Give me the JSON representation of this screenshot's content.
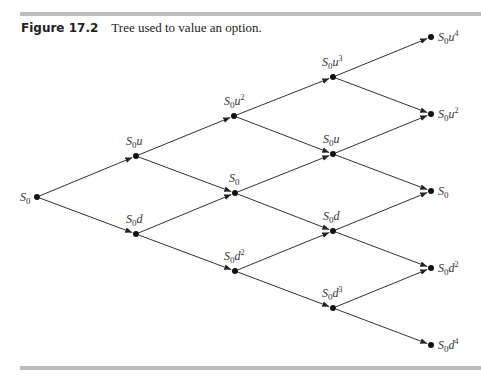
{
  "figure": {
    "number": "Figure 17.2",
    "title": "Tree used to value an option."
  },
  "tree": {
    "nodes": [
      {
        "id": "n00",
        "x": 37,
        "y": 197,
        "label": "S0",
        "sub": "0",
        "base": "S",
        "suffix": "",
        "exp": "",
        "lx": 20,
        "ly": 201
      },
      {
        "id": "n10",
        "x": 136,
        "y": 156,
        "base": "S",
        "sub": "0",
        "suffix": "u",
        "exp": "",
        "lx": 126,
        "ly": 145
      },
      {
        "id": "n11",
        "x": 136,
        "y": 234,
        "base": "S",
        "sub": "0",
        "suffix": "d",
        "exp": "",
        "lx": 126,
        "ly": 223
      },
      {
        "id": "n20",
        "x": 234,
        "y": 116,
        "base": "S",
        "sub": "0",
        "suffix": "u",
        "exp": "2",
        "lx": 224,
        "ly": 105
      },
      {
        "id": "n21",
        "x": 235,
        "y": 193,
        "base": "S",
        "sub": "0",
        "suffix": "",
        "exp": "",
        "lx": 229,
        "ly": 182
      },
      {
        "id": "n22",
        "x": 235,
        "y": 271,
        "base": "S",
        "sub": "0",
        "suffix": "d",
        "exp": "2",
        "lx": 224,
        "ly": 260
      },
      {
        "id": "n30",
        "x": 333,
        "y": 77,
        "base": "S",
        "sub": "0",
        "suffix": "u",
        "exp": "3",
        "lx": 322,
        "ly": 66
      },
      {
        "id": "n31",
        "x": 333,
        "y": 154,
        "base": "S",
        "sub": "0",
        "suffix": "u",
        "exp": "",
        "lx": 323,
        "ly": 143
      },
      {
        "id": "n32",
        "x": 333,
        "y": 231,
        "base": "S",
        "sub": "0",
        "suffix": "d",
        "exp": "",
        "lx": 323,
        "ly": 220
      },
      {
        "id": "n33",
        "x": 333,
        "y": 308,
        "base": "S",
        "sub": "0",
        "suffix": "d",
        "exp": "3",
        "lx": 322,
        "ly": 297
      },
      {
        "id": "n40",
        "x": 431,
        "y": 37,
        "base": "S",
        "sub": "0",
        "suffix": "u",
        "exp": "4",
        "lx": 438,
        "ly": 41
      },
      {
        "id": "n41",
        "x": 431,
        "y": 114,
        "base": "S",
        "sub": "0",
        "suffix": "u",
        "exp": "2",
        "lx": 438,
        "ly": 118
      },
      {
        "id": "n42",
        "x": 431,
        "y": 191,
        "base": "S",
        "sub": "0",
        "suffix": "",
        "exp": "",
        "lx": 438,
        "ly": 195
      },
      {
        "id": "n43",
        "x": 431,
        "y": 268,
        "base": "S",
        "sub": "0",
        "suffix": "d",
        "exp": "2",
        "lx": 438,
        "ly": 272
      },
      {
        "id": "n44",
        "x": 431,
        "y": 345,
        "base": "S",
        "sub": "0",
        "suffix": "d",
        "exp": "4",
        "lx": 438,
        "ly": 349
      }
    ],
    "edges": [
      [
        "n00",
        "n10"
      ],
      [
        "n00",
        "n11"
      ],
      [
        "n10",
        "n20"
      ],
      [
        "n10",
        "n21"
      ],
      [
        "n11",
        "n21"
      ],
      [
        "n11",
        "n22"
      ],
      [
        "n20",
        "n30"
      ],
      [
        "n20",
        "n31"
      ],
      [
        "n21",
        "n31"
      ],
      [
        "n21",
        "n32"
      ],
      [
        "n22",
        "n32"
      ],
      [
        "n22",
        "n33"
      ],
      [
        "n30",
        "n40"
      ],
      [
        "n30",
        "n41"
      ],
      [
        "n31",
        "n41"
      ],
      [
        "n31",
        "n42"
      ],
      [
        "n32",
        "n42"
      ],
      [
        "n32",
        "n43"
      ],
      [
        "n33",
        "n43"
      ],
      [
        "n33",
        "n44"
      ]
    ],
    "colors": {
      "line": "#333333",
      "node": "#111111",
      "rule": "#bdbdbd"
    }
  }
}
